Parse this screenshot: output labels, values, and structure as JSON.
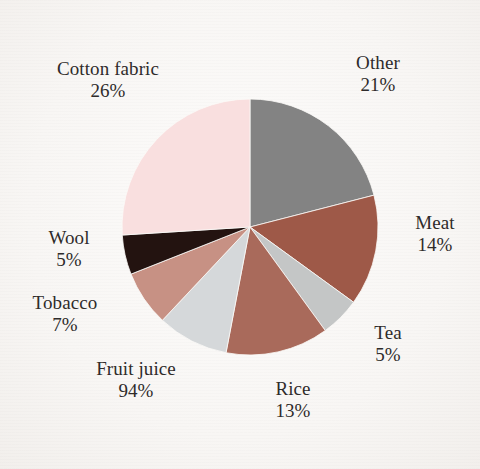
{
  "chart_data": {
    "type": "pie",
    "title": "",
    "subtitle": "",
    "xlabel": "",
    "ylabel": "",
    "legend_position": "none",
    "labels_position": "outside",
    "grid": false,
    "start_angle_deg": 0,
    "direction": "clockwise",
    "categories": [
      "Other",
      "Meat",
      "Tea",
      "Rice",
      "Fruit juice",
      "Tobacco",
      "Wool",
      "Cotton fabric"
    ],
    "values": [
      21,
      14,
      5,
      13,
      9,
      7,
      5,
      26
    ],
    "value_labels": [
      "21%",
      "14%",
      "5%",
      "13%",
      "94%",
      "7%",
      "5%",
      "26%"
    ],
    "colors": [
      "#838383",
      "#9e5948",
      "#c4c6c6",
      "#a96a5b",
      "#d5d8da",
      "#c79184",
      "#231310",
      "#f9dfdf"
    ],
    "slices": [
      {
        "name": "Other",
        "value": 21,
        "value_label": "21%",
        "color": "#838383"
      },
      {
        "name": "Meat",
        "value": 14,
        "value_label": "14%",
        "color": "#9e5948"
      },
      {
        "name": "Tea",
        "value": 5,
        "value_label": "5%",
        "color": "#c4c6c6"
      },
      {
        "name": "Rice",
        "value": 13,
        "value_label": "13%",
        "color": "#a96a5b"
      },
      {
        "name": "Fruit juice",
        "value": 9,
        "value_label": "94%",
        "color": "#d5d8da"
      },
      {
        "name": "Tobacco",
        "value": 7,
        "value_label": "7%",
        "color": "#c79184"
      },
      {
        "name": "Wool",
        "value": 5,
        "value_label": "5%",
        "color": "#231310"
      },
      {
        "name": "Cotton fabric",
        "value": 26,
        "value_label": "26%",
        "color": "#f9dfdf"
      }
    ]
  },
  "labels": {
    "cotton": {
      "name": "Cotton fabric",
      "pct": "26%"
    },
    "other": {
      "name": "Other",
      "pct": "21%"
    },
    "meat": {
      "name": "Meat",
      "pct": "14%"
    },
    "tea": {
      "name": "Tea",
      "pct": "5%"
    },
    "rice": {
      "name": "Rice",
      "pct": "13%"
    },
    "fruit": {
      "name": "Fruit juice",
      "pct": "94%"
    },
    "tobacco": {
      "name": "Tobacco",
      "pct": "7%"
    },
    "wool": {
      "name": "Wool",
      "pct": "5%"
    }
  },
  "geometry": {
    "center_x": 250,
    "center_y": 227,
    "radius": 128
  },
  "colors": {
    "background": "#fbfaf8",
    "label_text": "#2e2b2a"
  }
}
